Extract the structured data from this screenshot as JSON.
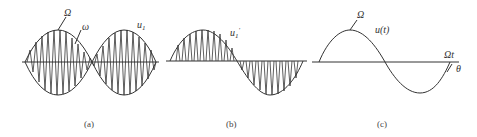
{
  "figure": {
    "panels": [
      {
        "id": "a",
        "caption": "(a)",
        "description": "Amplitude-modulated carrier: high-frequency carrier ω inside a low-frequency envelope Ω (double-sideband, phase reversal at zero crossing)",
        "labels": {
          "envelope": "Ω",
          "carrier": "ω",
          "signal": "u",
          "signal_sub": "1"
        }
      },
      {
        "id": "b",
        "caption": "(b)",
        "description": "Rectified/sampled carrier pulses following sinusoidal envelope (positive half above axis, negative half below)",
        "labels": {
          "signal": "u",
          "signal_sub": "1",
          "signal_sup": "′"
        }
      },
      {
        "id": "c",
        "caption": "(c)",
        "description": "Recovered modulating signal u(t) with frequency Ω",
        "labels": {
          "frequency": "Ω",
          "signal": "u(t)",
          "axis": "Ωt",
          "phase": "θ"
        }
      }
    ],
    "colors": {
      "stroke": "#333333",
      "background": "#ffffff"
    }
  }
}
